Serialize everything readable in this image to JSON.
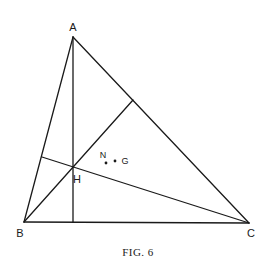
{
  "figure": {
    "caption": "Fig. 6",
    "caption_display": "FIG. 6",
    "line_color": "#1a1a1a",
    "background": "#ffffff"
  },
  "points": {
    "A": {
      "label": "A",
      "x": 73,
      "y": 37
    },
    "B": {
      "label": "B",
      "x": 24,
      "y": 222
    },
    "C": {
      "label": "C",
      "x": 249,
      "y": 223
    },
    "H": {
      "label": "H",
      "x": 72,
      "y": 168
    },
    "N": {
      "label": "N",
      "x": 106,
      "y": 163
    },
    "G": {
      "label": "G",
      "x": 115,
      "y": 161
    }
  },
  "segments": [
    {
      "name": "side-AB",
      "from": "A",
      "to": "B"
    },
    {
      "name": "side-AC",
      "from": "A",
      "to": "C"
    },
    {
      "name": "side-BC",
      "from": "B",
      "to": "C"
    },
    {
      "name": "altitude-from-A",
      "from": "A",
      "to_point": [
        73,
        222
      ]
    },
    {
      "name": "altitude-from-B",
      "from": "B",
      "to_point": [
        133,
        100
      ]
    },
    {
      "name": "altitude-from-C",
      "from": "C",
      "to_point": [
        42,
        157
      ]
    }
  ]
}
